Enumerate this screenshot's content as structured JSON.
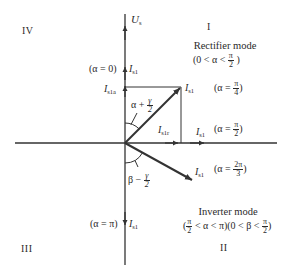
{
  "quadrants": {
    "q1": "I",
    "q2": "II",
    "q3": "III",
    "q4": "IV"
  },
  "axes": {
    "vertical_label_main": "U",
    "vertical_label_sub": "s"
  },
  "modes": {
    "rectifier": {
      "title": "Rectifier mode",
      "condition_prefix": "(0 < α <",
      "condition_num": "π",
      "condition_den": "2",
      "condition_suffix": ")"
    },
    "inverter": {
      "title": "Inverter mode",
      "cond_open": "(",
      "cond_num1": "π",
      "cond_den1": "2",
      "cond_mid": "< α < π)(0 < β <",
      "cond_num2": "π",
      "cond_den2": "2",
      "cond_close": ")"
    }
  },
  "vectors": {
    "alpha_0": {
      "annotation": "(α = 0)",
      "label_main": "I",
      "label_sub": "s1"
    },
    "active_component": {
      "label_main": "I",
      "label_sub": "s1a"
    },
    "alpha_pi_4": {
      "label_main": "I",
      "label_sub": "s1",
      "ann_prefix": "(α =",
      "ann_num": "π",
      "ann_den": "4",
      "ann_suffix": ")"
    },
    "reactive_component": {
      "label_main": "I",
      "label_sub": "s1r"
    },
    "alpha_pi_2": {
      "label_main": "I",
      "label_sub": "s1",
      "ann_prefix": "(α =",
      "ann_num": "π",
      "ann_den": "2",
      "ann_suffix": ")"
    },
    "alpha_2pi_3": {
      "label_main": "I",
      "label_sub": "s1",
      "ann_prefix": "(α =",
      "ann_num": "2π",
      "ann_den": "3",
      "ann_suffix": ")"
    },
    "alpha_pi": {
      "annotation": "(α = π)",
      "label_main": "I",
      "label_sub": "s1"
    }
  },
  "angles": {
    "rectifier_angle": {
      "prefix": "α +",
      "num": "γ",
      "den": "2"
    },
    "inverter_angle": {
      "prefix": "β −",
      "num": "γ",
      "den": "2"
    }
  },
  "colors": {
    "line": "#333333",
    "text": "#2a2a2a",
    "background": "#ffffff"
  }
}
